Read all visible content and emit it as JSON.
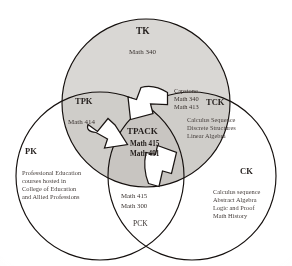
{
  "diagram": {
    "title": "TPACK",
    "type": "venn-3-circle",
    "colors": {
      "outline": "#15100e",
      "tk_fill": "#d9d7d4",
      "overlap_fill": "#cfcdc9",
      "arrow_fill": "#ffffff",
      "text": "#241f1d",
      "background": "#ffffff"
    },
    "regions": {
      "tk": {
        "label": "TK",
        "courses": [
          "Math 340"
        ]
      },
      "pk": {
        "label": "PK",
        "description_lines": [
          "Professional Education",
          "courses hosted in",
          "College of Education",
          "and Allied Professions"
        ]
      },
      "ck": {
        "label": "CK",
        "description_lines": [
          "Calculus sequence",
          "Abstract Algebra",
          "Logic and Proof",
          "Math History"
        ]
      },
      "tpk": {
        "label": "TPK",
        "courses": [
          "Math 414"
        ]
      },
      "tck": {
        "label": "TCK",
        "courses": [
          "Capstone",
          "Math 340",
          "Math 413"
        ],
        "description_lines": [
          "Calculus Sequence",
          "Discrete Structures",
          "Linear Algebra"
        ]
      },
      "pck": {
        "label": "PCK",
        "courses": [
          "Math 415",
          "Math 300"
        ]
      },
      "tpack": {
        "label": "TPACK",
        "courses": [
          "Math 415",
          "Math 491"
        ]
      }
    },
    "arrows": [
      {
        "name": "arrow-top",
        "direction": "clockwise"
      },
      {
        "name": "arrow-left",
        "direction": "clockwise"
      },
      {
        "name": "arrow-bottom-right",
        "direction": "clockwise"
      }
    ]
  }
}
